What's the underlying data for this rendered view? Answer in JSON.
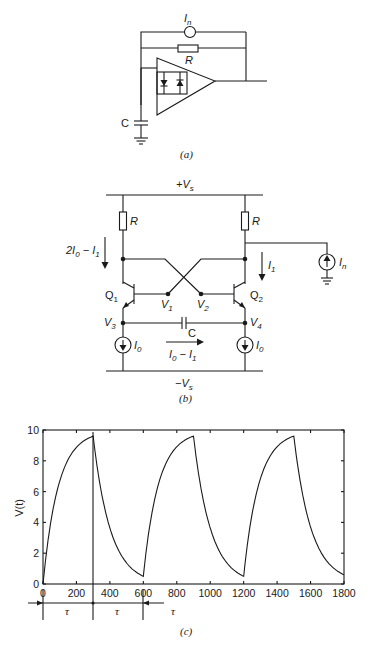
{
  "figure_a": {
    "caption": "(a)",
    "labels": {
      "noise_source": "I",
      "noise_source_sub": "n",
      "resistor": "R",
      "capacitor": "C"
    }
  },
  "figure_b": {
    "caption": "(b)",
    "labels": {
      "supply_pos": "+V",
      "supply_pos_sub": "s",
      "supply_neg": "−V",
      "supply_neg_sub": "s",
      "resistor_left": "R",
      "resistor_right": "R",
      "current_left_a": "2I",
      "current_left_a_sub": "0",
      "current_left_b": " − I",
      "current_left_b_sub": "1",
      "current_right": "I",
      "current_right_sub": "1",
      "noise_source": "I",
      "noise_source_sub": "n",
      "transistor_left": "Q",
      "transistor_left_sub": "1",
      "transistor_right": "Q",
      "transistor_right_sub": "2",
      "node_v1": "V",
      "node_v1_sub": "1",
      "node_v2": "V",
      "node_v2_sub": "2",
      "node_v3": "V",
      "node_v3_sub": "3",
      "node_v4": "V",
      "node_v4_sub": "4",
      "capacitor": "C",
      "source_left": "I",
      "source_left_sub": "0",
      "source_right": "I",
      "source_right_sub": "0",
      "cap_current_a": "I",
      "cap_current_a_sub": "0",
      "cap_current_b": " − I",
      "cap_current_b_sub": "1"
    }
  },
  "figure_c": {
    "caption": "(c)",
    "tau_label": "τ"
  },
  "chart_data": {
    "type": "line",
    "title": "",
    "xlabel": "",
    "ylabel": "V(t)",
    "xlim": [
      0,
      1800
    ],
    "ylim": [
      0,
      10
    ],
    "x_ticks": [
      "0",
      "200",
      "400",
      "600",
      "800",
      "1000",
      "1200",
      "1400",
      "1600",
      "1800"
    ],
    "y_ticks": [
      "0",
      "2",
      "4",
      "6",
      "8",
      "10"
    ],
    "grid": false,
    "legend": "none",
    "series": [
      {
        "name": "V(t)",
        "x": [
          0,
          50,
          100,
          150,
          200,
          250,
          300,
          300,
          350,
          400,
          450,
          500,
          550,
          600,
          600,
          650,
          700,
          750,
          800,
          850,
          900,
          900,
          950,
          1000,
          1050,
          1100,
          1150,
          1200,
          1200,
          1250,
          1300,
          1350,
          1400,
          1450,
          1500,
          1500,
          1550,
          1600,
          1650,
          1700,
          1750,
          1800
        ],
        "values": [
          0,
          4.2,
          6.4,
          7.8,
          8.7,
          9.2,
          9.6,
          9.6,
          6.1,
          3.9,
          2.5,
          1.6,
          1.0,
          0.5,
          0.5,
          4.4,
          6.6,
          7.9,
          8.8,
          9.3,
          9.6,
          9.6,
          6.1,
          3.9,
          2.5,
          1.6,
          1.0,
          0.5,
          0.5,
          4.4,
          6.6,
          7.9,
          8.8,
          9.3,
          9.6,
          9.6,
          6.1,
          3.9,
          2.5,
          1.6,
          1.0,
          0.6
        ]
      }
    ],
    "annotations": [
      {
        "text": "τ",
        "x_range": [
          0,
          300
        ]
      },
      {
        "text": "τ",
        "x_range": [
          300,
          600
        ]
      },
      {
        "text": "τ",
        "x_range": [
          600,
          900
        ]
      },
      {
        "text": "",
        "type": "vertical-line",
        "x": 300
      }
    ]
  }
}
